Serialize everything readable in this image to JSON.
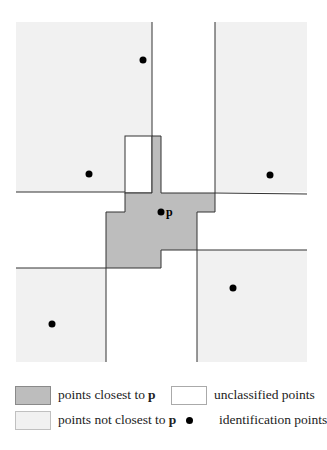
{
  "diagram": {
    "colors": {
      "closest": "#bdbdbd",
      "not_closest": "#f1f1f1",
      "unclassified": "#ffffff",
      "line": "#333333",
      "point": "#000000"
    },
    "regions_not_closest": [
      {
        "name": "top-left",
        "x": 16,
        "y": 22,
        "w": 136,
        "h": 170
      },
      {
        "name": "top-right",
        "x": 215,
        "y": 22,
        "w": 92,
        "h": 170
      },
      {
        "name": "bottom-left",
        "x": 16,
        "y": 268,
        "w": 90,
        "h": 94
      },
      {
        "name": "bottom-right",
        "x": 197,
        "y": 250,
        "w": 110,
        "h": 112
      }
    ],
    "closest_polygon": "152,136 161,136 161,193 215,193 215,212 197,212 197,250 161,250 161,268 106,268 106,212 125,212 125,193 152,193",
    "unclassified_box": {
      "x": 125,
      "y": 136,
      "w": 27,
      "h": 57
    },
    "points": [
      {
        "name": "top-left-point",
        "x": 143,
        "y": 60
      },
      {
        "name": "left-point",
        "x": 89,
        "y": 174
      },
      {
        "name": "right-point",
        "x": 270,
        "y": 175
      },
      {
        "name": "p-point",
        "x": 161,
        "y": 212,
        "label": "p"
      },
      {
        "name": "bottom-right-point",
        "x": 233,
        "y": 288
      },
      {
        "name": "bottom-left-point",
        "x": 52,
        "y": 324
      }
    ]
  },
  "legend": {
    "closest_label": "points closest to",
    "not_closest_label": "points not closest to",
    "unclassified_label": "unclassified points",
    "identification_label": "identification points",
    "p_symbol": "p"
  }
}
